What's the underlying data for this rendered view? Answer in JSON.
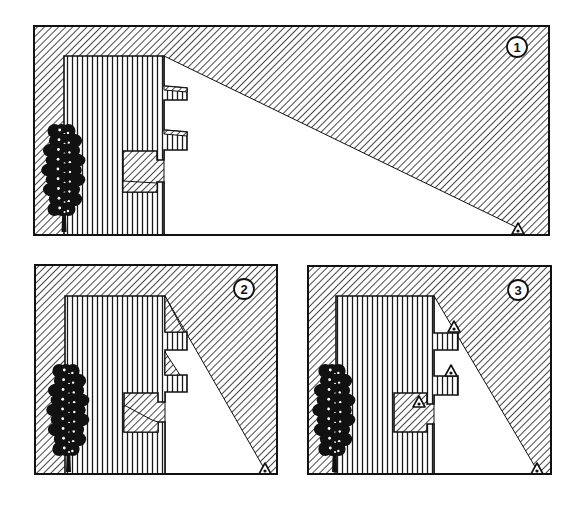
{
  "diagram": {
    "colors": {
      "ink": "#111111",
      "paper": "#ffffff",
      "hatch_diagonal": "#1a1a1a",
      "hatch_vertical": "#1a1a1a"
    },
    "panels": [
      {
        "id": "panel-1",
        "label": "1",
        "frame": {
          "x": 34,
          "y": 26,
          "w": 515,
          "h": 209
        },
        "label_pos": {
          "cx": 517,
          "cy": 47,
          "r": 10
        },
        "building": {
          "outline": [
            [
              64,
              56
            ],
            [
              164,
              56
            ],
            [
              164,
              86
            ],
            [
              187,
              88
            ],
            [
              187,
              100
            ],
            [
              164,
              100
            ],
            [
              164,
              130
            ],
            [
              187,
              132
            ],
            [
              187,
              150
            ],
            [
              164,
              150
            ],
            [
              164,
              160
            ],
            [
              157,
              160
            ],
            [
              157,
              151
            ],
            [
              123,
              151
            ],
            [
              123,
              192
            ],
            [
              157,
              192
            ],
            [
              157,
              182
            ],
            [
              164,
              182
            ],
            [
              164,
              235
            ],
            [
              64,
              235
            ]
          ],
          "balcony_shadows": [
            [
              [
                164,
                86
              ],
              [
                187,
                88
              ],
              [
                187,
                92
              ],
              [
                164,
                90
              ]
            ],
            [
              [
                164,
                130
              ],
              [
                187,
                132
              ],
              [
                187,
                136
              ],
              [
                164,
                134
              ]
            ],
            [
              [
                123,
                181
              ],
              [
                157,
                183
              ],
              [
                157,
                192
              ],
              [
                123,
                192
              ]
            ]
          ]
        },
        "light_region": [
          [
            164,
            56
          ],
          [
            518,
            228
          ],
          [
            518,
            235
          ],
          [
            164,
            235
          ]
        ],
        "observers": [
          {
            "name": "eye-ground",
            "x": 518,
            "y": 228
          }
        ],
        "tree": {
          "x": 45,
          "top": 125,
          "bottom": 232,
          "w": 37
        }
      },
      {
        "id": "panel-2",
        "label": "2",
        "frame": {
          "x": 35,
          "y": 265,
          "w": 242,
          "h": 209
        },
        "label_pos": {
          "cx": 244,
          "cy": 289,
          "r": 10
        },
        "building": {
          "outline": [
            [
              65,
              296
            ],
            [
              165,
              296
            ],
            [
              165,
              332
            ],
            [
              187,
              332
            ],
            [
              187,
              350
            ],
            [
              165,
              350
            ],
            [
              165,
              375
            ],
            [
              187,
              375
            ],
            [
              187,
              392
            ],
            [
              165,
              392
            ],
            [
              165,
              402
            ],
            [
              158,
              402
            ],
            [
              158,
              393
            ],
            [
              124,
              393
            ],
            [
              124,
              432
            ],
            [
              158,
              432
            ],
            [
              158,
              422
            ],
            [
              165,
              422
            ],
            [
              165,
              474
            ],
            [
              65,
              474
            ]
          ],
          "balcony_shadows": [
            [
              [
                165,
                296
              ],
              [
                184,
                332
              ],
              [
                165,
                332
              ]
            ],
            [
              [
                165,
                352
              ],
              [
                180,
                375
              ],
              [
                165,
                375
              ]
            ],
            [
              [
                124,
                405
              ],
              [
                152,
                420
              ],
              [
                158,
                422
              ],
              [
                158,
                432
              ],
              [
                124,
                432
              ]
            ]
          ]
        },
        "light_region": [
          [
            165,
            296
          ],
          [
            265,
            470
          ],
          [
            265,
            474
          ],
          [
            165,
            474
          ]
        ],
        "observers": [
          {
            "name": "eye-ground",
            "x": 265,
            "y": 468
          }
        ],
        "tree": {
          "x": 50,
          "top": 365,
          "bottom": 472,
          "w": 36
        }
      },
      {
        "id": "panel-3",
        "label": "3",
        "frame": {
          "x": 308,
          "y": 266,
          "w": 243,
          "h": 208
        },
        "label_pos": {
          "cx": 518,
          "cy": 290,
          "r": 10
        },
        "building": {
          "outline": [
            [
              336,
              296
            ],
            [
              434,
              296
            ],
            [
              434,
              333
            ],
            [
              458,
              333
            ],
            [
              458,
              350
            ],
            [
              434,
              350
            ],
            [
              434,
              376
            ],
            [
              458,
              376
            ],
            [
              458,
              395
            ],
            [
              434,
              395
            ],
            [
              434,
              404
            ],
            [
              427,
              404
            ],
            [
              427,
              393
            ],
            [
              394,
              393
            ],
            [
              394,
              432
            ],
            [
              427,
              432
            ],
            [
              427,
              424
            ],
            [
              434,
              424
            ],
            [
              434,
              474
            ],
            [
              336,
              474
            ]
          ],
          "balcony_shadows": []
        },
        "light_region": [
          [
            434,
            296
          ],
          [
            537,
            470
          ],
          [
            537,
            474
          ],
          [
            434,
            474
          ]
        ],
        "observers": [
          {
            "name": "eye-balcony-upper",
            "x": 454,
            "y": 326
          },
          {
            "name": "eye-balcony-lower",
            "x": 451,
            "y": 370
          },
          {
            "name": "eye-recess",
            "x": 419,
            "y": 401
          },
          {
            "name": "eye-ground",
            "x": 537,
            "y": 468
          }
        ],
        "tree": {
          "x": 316,
          "top": 365,
          "bottom": 472,
          "w": 36
        }
      }
    ]
  }
}
